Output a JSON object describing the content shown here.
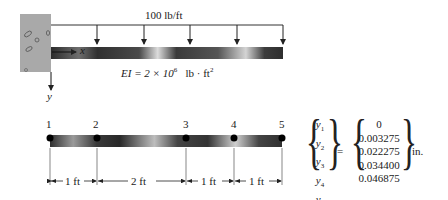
{
  "top_figure": {
    "load_label": "100 lb/ft",
    "x_axis_label": "x",
    "y_axis_label": "y",
    "stiffness_label_prefix": "EI = 2 × 10",
    "stiffness_exponent": "6",
    "stiffness_units": "lb · ft",
    "stiffness_units_exponent": "2",
    "load_arrow_count": 5
  },
  "bottom_figure": {
    "nodes": [
      "1",
      "2",
      "3",
      "4",
      "5"
    ],
    "spacings": [
      "1 ft",
      "2 ft",
      "1 ft",
      "1 ft"
    ]
  },
  "equation": {
    "lhs": [
      {
        "symbol": "y",
        "sub": "1"
      },
      {
        "symbol": "y",
        "sub": "2"
      },
      {
        "symbol": "y",
        "sub": "3"
      },
      {
        "symbol": "y",
        "sub": "4"
      },
      {
        "symbol": "y",
        "sub": "5"
      }
    ],
    "equals": "=",
    "rhs": [
      "0",
      "0.003275",
      "0.022275",
      "0.034400",
      "0.046875"
    ],
    "units": "in."
  },
  "colors": {
    "wall": "#a9a9a9",
    "beam_dark": "#2b2b2b",
    "beam_light": "#d9d9d9",
    "line": "#222222"
  }
}
